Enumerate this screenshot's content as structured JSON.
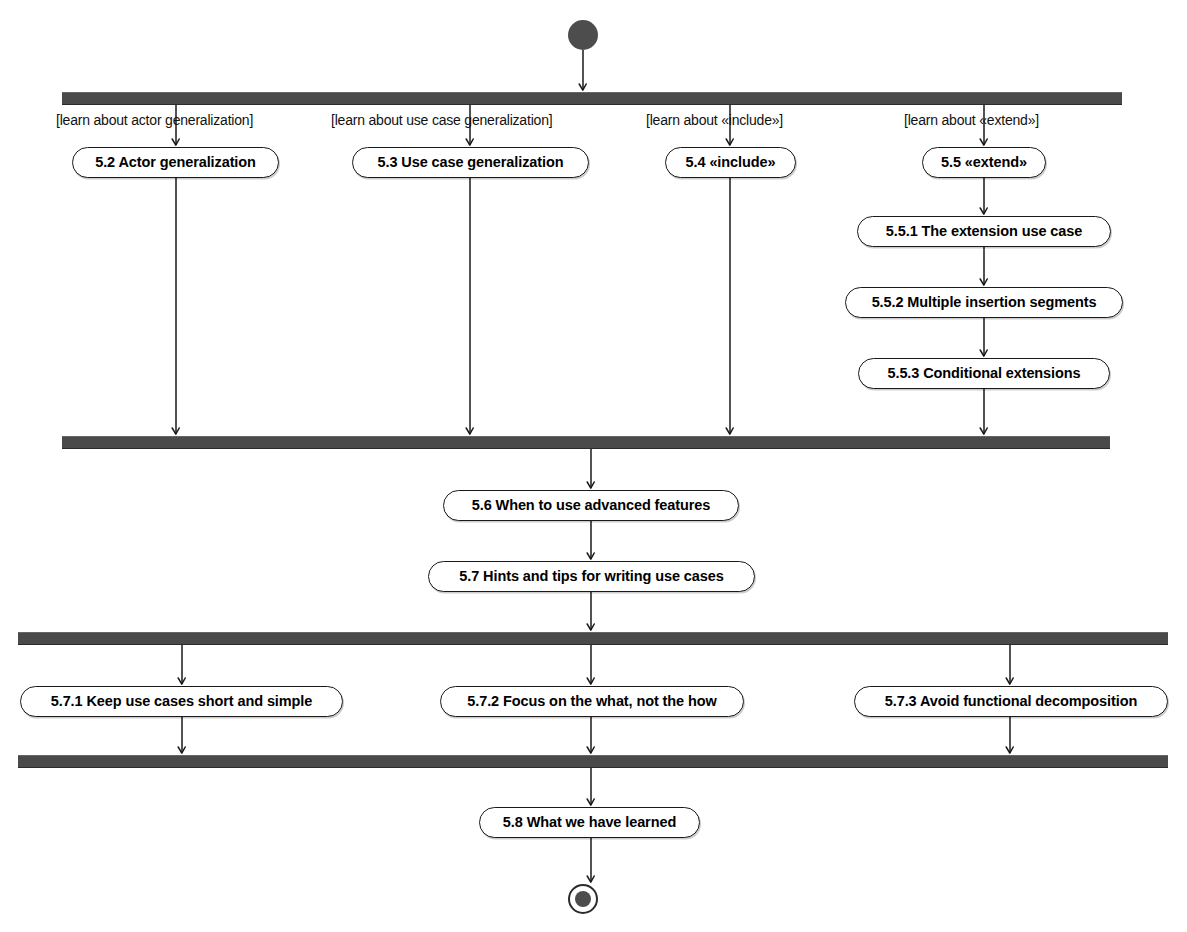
{
  "diagram": {
    "type": "uml-activity-diagram",
    "canvas": {
      "width": 1187,
      "height": 932
    },
    "colors": {
      "bar": "#4a4a4a",
      "node_fill": "#ffffff",
      "node_stroke": "#1a1a1a",
      "initial_node": "#4d4d4d",
      "text": "#000000",
      "background": "#ffffff"
    }
  },
  "nodes": {
    "initial": {
      "name": "initial-node",
      "cx": 583,
      "cy": 35,
      "r": 15
    },
    "final": {
      "name": "final-node",
      "cx": 583,
      "cy": 899,
      "r_outer": 15,
      "r_inner": 8
    }
  },
  "bars": [
    {
      "id": "fork-1",
      "label": "fork-bar-top",
      "x": 62,
      "y": 92,
      "width": 1060,
      "height": 11
    },
    {
      "id": "join-1",
      "label": "join-bar-upper-middle",
      "x": 62,
      "y": 436,
      "width": 1048,
      "height": 11
    },
    {
      "id": "fork-2",
      "label": "fork-bar-lower-middle",
      "x": 18,
      "y": 632,
      "width": 1150,
      "height": 11
    },
    {
      "id": "join-2",
      "label": "join-bar-bottom",
      "x": 18,
      "y": 755,
      "width": 1150,
      "height": 11
    }
  ],
  "guards": [
    {
      "id": "g1",
      "text": "[learn about actor generalization]",
      "x": 56,
      "y": 112
    },
    {
      "id": "g2",
      "text": "[learn about use case generalization]",
      "x": 331,
      "y": 112
    },
    {
      "id": "g3",
      "text": "[learn about «include»]",
      "x": 646,
      "y": 112
    },
    {
      "id": "g4",
      "text": "[learn about «extend»]",
      "x": 904,
      "y": 112
    }
  ],
  "activities": [
    {
      "id": "a52",
      "text": "5.2 Actor generalization",
      "x": 72,
      "y": 147,
      "width": 207,
      "height": 31
    },
    {
      "id": "a53",
      "text": "5.3 Use case generalization",
      "x": 352,
      "y": 147,
      "width": 237,
      "height": 31
    },
    {
      "id": "a54",
      "text": "5.4 «include»",
      "x": 665,
      "y": 147,
      "width": 131,
      "height": 31
    },
    {
      "id": "a55",
      "text": "5.5 «extend»",
      "x": 922,
      "y": 147,
      "width": 124,
      "height": 31
    },
    {
      "id": "a551",
      "text": "5.5.1 The extension use case",
      "x": 857,
      "y": 216,
      "width": 254,
      "height": 31
    },
    {
      "id": "a552",
      "text": "5.5.2 Multiple insertion segments",
      "x": 845,
      "y": 287,
      "width": 278,
      "height": 31
    },
    {
      "id": "a553",
      "text": "5.5.3 Conditional extensions",
      "x": 858,
      "y": 358,
      "width": 252,
      "height": 31
    },
    {
      "id": "a56",
      "text": "5.6 When to use advanced features",
      "x": 443,
      "y": 490,
      "width": 296,
      "height": 31
    },
    {
      "id": "a57",
      "text": "5.7 Hints and tips for writing use cases",
      "x": 428,
      "y": 561,
      "width": 327,
      "height": 31
    },
    {
      "id": "a571",
      "text": "5.7.1 Keep use cases short and simple",
      "x": 20,
      "y": 686,
      "width": 323,
      "height": 31
    },
    {
      "id": "a572",
      "text": "5.7.2 Focus on the what, not the how",
      "x": 440,
      "y": 686,
      "width": 304,
      "height": 31
    },
    {
      "id": "a573",
      "text": "5.7.3 Avoid functional decomposition",
      "x": 854,
      "y": 686,
      "width": 314,
      "height": 31
    },
    {
      "id": "a58",
      "text": "5.8 What we have learned",
      "x": 479,
      "y": 807,
      "width": 221,
      "height": 31
    }
  ],
  "edges": [
    {
      "id": "e-init-fork1",
      "from": "initial",
      "to": "fork-1",
      "path": "M 583 50 L 583 90",
      "arrow": true
    },
    {
      "id": "e-fork1-52",
      "from": "fork-1",
      "to": "5.2",
      "path": "M 176 103 L 176 145",
      "arrow": true
    },
    {
      "id": "e-fork1-53",
      "from": "fork-1",
      "to": "5.3",
      "path": "M 470 103 L 470 145",
      "arrow": true
    },
    {
      "id": "e-fork1-54",
      "from": "fork-1",
      "to": "5.4",
      "path": "M 730 103 L 730 145",
      "arrow": true
    },
    {
      "id": "e-fork1-55",
      "from": "fork-1",
      "to": "5.5",
      "path": "M 984 103 L 984 145",
      "arrow": true
    },
    {
      "id": "e-52-join1",
      "from": "5.2",
      "to": "join-1",
      "path": "M 176 178 L 176 434",
      "arrow": true
    },
    {
      "id": "e-53-join1",
      "from": "5.3",
      "to": "join-1",
      "path": "M 470 178 L 470 434",
      "arrow": true
    },
    {
      "id": "e-54-join1",
      "from": "5.4",
      "to": "join-1",
      "path": "M 730 178 L 730 434",
      "arrow": true
    },
    {
      "id": "e-55-551",
      "from": "5.5",
      "to": "5.5.1",
      "path": "M 984 178 L 984 214",
      "arrow": true
    },
    {
      "id": "e-551-552",
      "from": "5.5.1",
      "to": "5.5.2",
      "path": "M 984 247 L 984 285",
      "arrow": true
    },
    {
      "id": "e-552-553",
      "from": "5.5.2",
      "to": "5.5.3",
      "path": "M 984 318 L 984 356",
      "arrow": true
    },
    {
      "id": "e-553-join1",
      "from": "5.5.3",
      "to": "join-1",
      "path": "M 984 389 L 984 434",
      "arrow": true
    },
    {
      "id": "e-join1-56",
      "from": "join-1",
      "to": "5.6",
      "path": "M 591 447 L 591 488",
      "arrow": true
    },
    {
      "id": "e-56-57",
      "from": "5.6",
      "to": "5.7",
      "path": "M 591 521 L 591 559",
      "arrow": true
    },
    {
      "id": "e-57-fork2",
      "from": "5.7",
      "to": "fork-2",
      "path": "M 591 592 L 591 630",
      "arrow": true
    },
    {
      "id": "e-fork2-571",
      "from": "fork-2",
      "to": "5.7.1",
      "path": "M 182 643 L 182 684",
      "arrow": true
    },
    {
      "id": "e-fork2-572",
      "from": "fork-2",
      "to": "5.7.2",
      "path": "M 591 643 L 591 684",
      "arrow": true
    },
    {
      "id": "e-fork2-573",
      "from": "fork-2",
      "to": "5.7.3",
      "path": "M 1010 643 L 1010 684",
      "arrow": true
    },
    {
      "id": "e-571-join2",
      "from": "5.7.1",
      "to": "join-2",
      "path": "M 182 717 L 182 753",
      "arrow": true
    },
    {
      "id": "e-572-join2",
      "from": "5.7.2",
      "to": "join-2",
      "path": "M 591 717 L 591 753",
      "arrow": true
    },
    {
      "id": "e-573-join2",
      "from": "5.7.3",
      "to": "join-2",
      "path": "M 1010 717 L 1010 753",
      "arrow": true
    },
    {
      "id": "e-join2-58",
      "from": "join-2",
      "to": "5.8",
      "path": "M 591 766 L 591 805",
      "arrow": true
    },
    {
      "id": "e-58-final",
      "from": "5.8",
      "to": "final",
      "path": "M 591 838 L 591 882",
      "arrow": true
    }
  ]
}
